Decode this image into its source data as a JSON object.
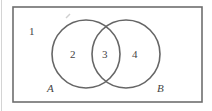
{
  "diagram": {
    "type": "venn",
    "universe": {
      "x": 13,
      "y": 7,
      "width": 189,
      "height": 95,
      "stroke": "#6e6e6e"
    },
    "sets": [
      {
        "name": "A",
        "cx": 86,
        "cy": 54,
        "r": 34,
        "label_x": 49,
        "label_y": 92
      },
      {
        "name": "B",
        "cx": 126,
        "cy": 54,
        "r": 34,
        "label_x": 158,
        "label_y": 92
      }
    ],
    "circle_stroke": "#666666",
    "regions": [
      {
        "id": "1",
        "label": "1",
        "x": 31,
        "y": 35,
        "description": "outside A and B"
      },
      {
        "id": "2",
        "label": "2",
        "x": 73,
        "y": 58,
        "description": "A only"
      },
      {
        "id": "3",
        "label": "3",
        "x": 105,
        "y": 58,
        "description": "A and B"
      },
      {
        "id": "4",
        "label": "4",
        "x": 135,
        "y": 58,
        "description": "B only"
      }
    ]
  }
}
